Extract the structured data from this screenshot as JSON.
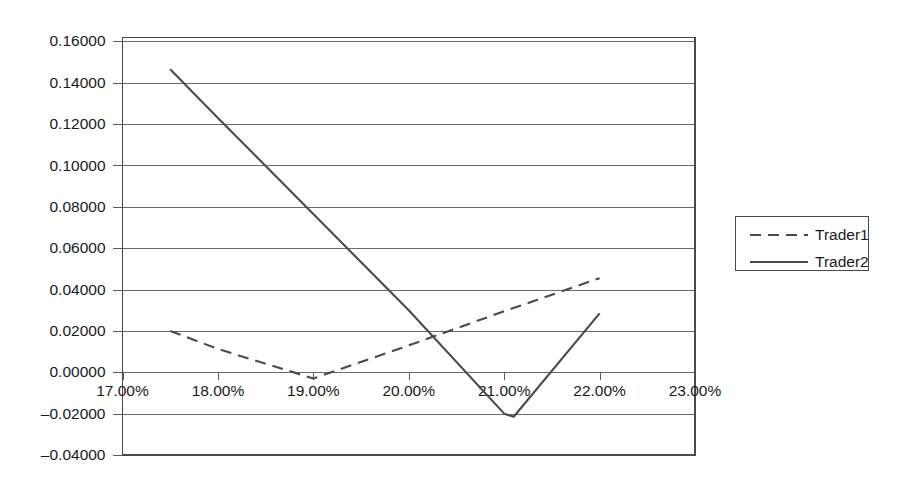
{
  "chart_data": {
    "type": "line",
    "title": "",
    "xlabel": "",
    "ylabel": "",
    "xlim": [
      17.0,
      23.0
    ],
    "ylim": [
      -0.04,
      0.16
    ],
    "grid": true,
    "legend_position": "right",
    "x_tick_labels": [
      "17.00%",
      "18.00%",
      "19.00%",
      "20.00%",
      "21.00%",
      "22.00%",
      "23.00%"
    ],
    "x_tick_values": [
      17.0,
      18.0,
      19.0,
      20.0,
      21.0,
      22.0,
      23.0
    ],
    "y_tick_labels": [
      "0.16000",
      "0.14000",
      "0.12000",
      "0.10000",
      "0.08000",
      "0.06000",
      "0.04000",
      "0.02000",
      "0.00000",
      "–0.02000",
      "–0.04000"
    ],
    "y_tick_values": [
      0.16,
      0.14,
      0.12,
      0.1,
      0.08,
      0.06,
      0.04,
      0.02,
      0.0,
      -0.02,
      -0.04
    ],
    "series": [
      {
        "name": "Trader1",
        "style": "dashed",
        "color": "#4a4a4a",
        "x": [
          17.5,
          18.0,
          19.0,
          20.0,
          21.0,
          22.0
        ],
        "values": [
          0.02,
          0.0113,
          -0.003,
          0.013,
          0.0295,
          0.0455
        ]
      },
      {
        "name": "Trader2",
        "style": "solid",
        "color": "#4a4a4a",
        "x": [
          17.5,
          18.0,
          19.0,
          20.0,
          21.0,
          21.1,
          22.0
        ],
        "values": [
          0.1465,
          0.123,
          0.0765,
          0.03,
          -0.02,
          -0.0215,
          0.0285
        ]
      }
    ],
    "legend_entries": [
      "Trader1",
      "Trader2"
    ]
  },
  "colors": {
    "series_stroke": "#4a4a4a",
    "gridline": "#6b6b6b",
    "frame": "#4a4a4a",
    "background": "#ffffff",
    "text": "#1a1a1a"
  }
}
